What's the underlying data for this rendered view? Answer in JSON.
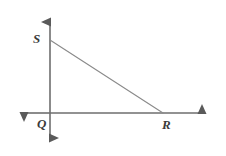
{
  "figure": {
    "background_color": "#ffffff",
    "width": 226,
    "height": 156
  },
  "labels": {
    "s": "S",
    "q": "Q",
    "r": "R"
  },
  "style": {
    "axis_color": "#6e6e6e",
    "segment_color": "#8a8a8a",
    "label_color": "#3b3b3b",
    "axis_stroke_width": 1.6,
    "segment_stroke_width": 1.1
  },
  "geometry": {
    "origin": {
      "x": 50,
      "y": 113
    },
    "points": {
      "S": {
        "x": 50,
        "y": 40
      },
      "Q": {
        "x": 50,
        "y": 113
      },
      "R": {
        "x": 163,
        "y": 113
      }
    },
    "vertical_axis": {
      "x": 50,
      "y_top": 12,
      "y_bottom": 148
    },
    "horizontal_axis": {
      "y": 113,
      "x_left": 14,
      "x_right": 212
    },
    "segments": [
      {
        "name": "SR",
        "from": "S",
        "to": "R"
      },
      {
        "name": "SQ",
        "from": "S",
        "to": "Q"
      },
      {
        "name": "QR",
        "from": "Q",
        "to": "R"
      }
    ],
    "arrowheads": [
      "up",
      "down",
      "left",
      "right"
    ]
  }
}
